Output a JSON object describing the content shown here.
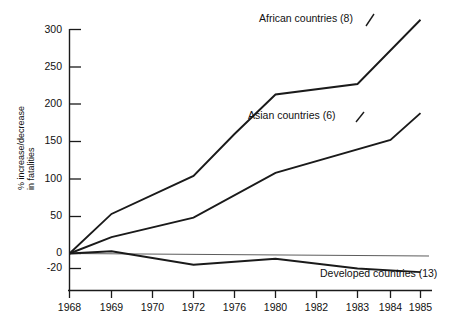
{
  "chart_data": {
    "type": "line",
    "title": "",
    "subtitle": "",
    "xlabel": "",
    "ylabel": "% increase/decrease in fatalities",
    "ylabel_line1": "% increase/decrease",
    "ylabel_line2": "in fatalities",
    "grid": false,
    "legend_position": "inline-annotations",
    "x": [
      "1968",
      "1969",
      "1970",
      "1972",
      "1976",
      "1980",
      "1982",
      "1983",
      "1984",
      "1985"
    ],
    "xtick_labels": [
      "1968",
      "1969",
      "1970",
      "1972",
      "1976",
      "1980",
      "1982",
      "1983",
      "1984",
      "1985"
    ],
    "ytick_labels": [
      "300",
      "250",
      "200",
      "150",
      "100",
      "50",
      "0",
      "-20"
    ],
    "ytick_values": [
      300,
      250,
      200,
      150,
      100,
      50,
      0,
      -20
    ],
    "ylim": [
      -30,
      320
    ],
    "series": [
      {
        "name": "African countries (8)",
        "label": "African countries (8)",
        "count": 8,
        "points": [
          {
            "x": "1968",
            "y": 0
          },
          {
            "x": "1969",
            "y": 53
          },
          {
            "x": "1972",
            "y": 104
          },
          {
            "x": "1976",
            "y": 160
          },
          {
            "x": "1980",
            "y": 213
          },
          {
            "x": "1983",
            "y": 227
          },
          {
            "x": "1985",
            "y": 313
          }
        ]
      },
      {
        "name": "Asian countries (6)",
        "label": "Asian countries (6)",
        "count": 6,
        "points": [
          {
            "x": "1968",
            "y": 0
          },
          {
            "x": "1969",
            "y": 22
          },
          {
            "x": "1972",
            "y": 48
          },
          {
            "x": "1980",
            "y": 108
          },
          {
            "x": "1984",
            "y": 152
          },
          {
            "x": "1985",
            "y": 188
          }
        ]
      },
      {
        "name": "Developed countries (13)",
        "label": "Developed countries (13)",
        "count": 13,
        "points": [
          {
            "x": "1968",
            "y": 0
          },
          {
            "x": "1969",
            "y": 3
          },
          {
            "x": "1972",
            "y": -15
          },
          {
            "x": "1980",
            "y": -7
          },
          {
            "x": "1983",
            "y": -20
          },
          {
            "x": "1985",
            "y": -25
          }
        ]
      }
    ],
    "annotations": [
      {
        "text": "African countries (8)",
        "anchor": "african-series"
      },
      {
        "text": "Asian countries (6)",
        "anchor": "asian-series"
      },
      {
        "text": "Developed countries (13)",
        "anchor": "developed-series"
      }
    ],
    "line_color": "#1a1a1a",
    "background_color": "#ffffff"
  }
}
